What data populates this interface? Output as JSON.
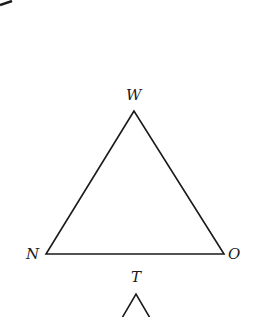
{
  "diagram": {
    "type": "geometry-triangles",
    "stroke_color": "#1a1a1a",
    "background": "#ffffff",
    "triangle_1": {
      "vertices": {
        "W": {
          "label": "W",
          "x": 134,
          "y": 111
        },
        "N": {
          "label": "N",
          "x": 46,
          "y": 254
        },
        "O": {
          "label": "O",
          "x": 224,
          "y": 254
        }
      }
    },
    "triangle_2": {
      "vertices": {
        "T": {
          "label": "T",
          "x": 136,
          "y": 293
        }
      },
      "partial": true
    },
    "arc_fragment": {
      "visible": true,
      "position": "top-left"
    }
  }
}
